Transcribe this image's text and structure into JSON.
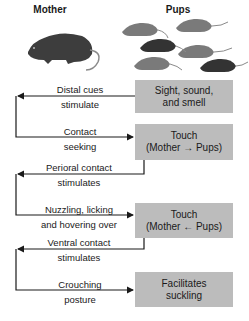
{
  "headers": {
    "mother": "Mother",
    "pups": "Pups"
  },
  "icons": {
    "mother": "rat-icon",
    "pups": "rat-group-icon"
  },
  "boxes": [
    {
      "line1": "Sight, sound,",
      "line2": "and smell"
    },
    {
      "line1": "Touch",
      "line2": "(Mother → Pups)"
    },
    {
      "line1": "Touch",
      "line2": "(Mother ← Pups)"
    },
    {
      "line1": "Facilitates",
      "line2": "suckling"
    }
  ],
  "labels": [
    {
      "line1": "Distal cues",
      "line2": "stimulate"
    },
    {
      "line1": "Contact",
      "line2": "seeking"
    },
    {
      "line1": "Perioral contact",
      "line2": "stimulates"
    },
    {
      "line1": "Nuzzling, licking",
      "line2": "and hovering over"
    },
    {
      "line1": "Ventral contact",
      "line2": "stimulates"
    },
    {
      "line1": "Crouching",
      "line2": "posture"
    }
  ],
  "colors": {
    "box": "#bcbcbc",
    "line": "#1a1a1a",
    "mother_rat": "#3d3d3d",
    "pup_light": "#7a7a7a",
    "pup_dark": "#333333"
  }
}
